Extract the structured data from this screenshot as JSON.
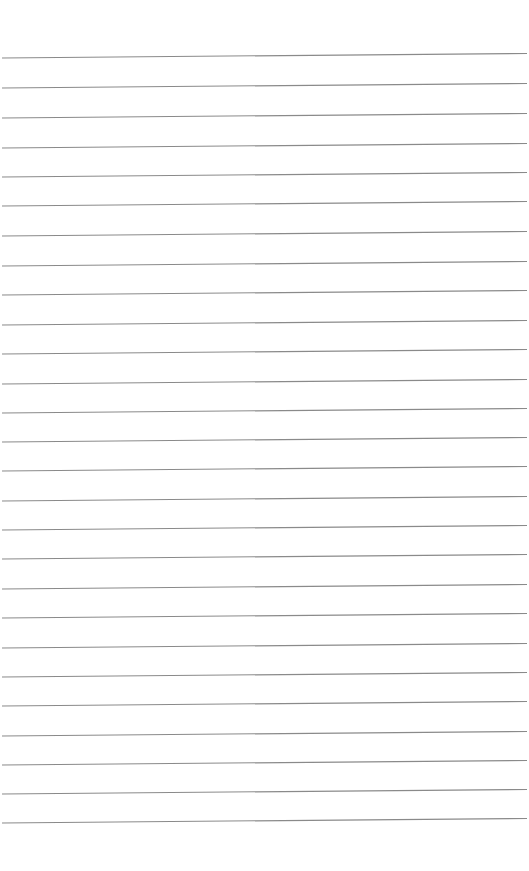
{
  "page": {
    "type": "blank lined paper",
    "background_color": "#ffffff",
    "line_color": "#8a8a8a",
    "line_count": 27,
    "line_start_x": 2,
    "line_end_x": 527,
    "left_y": [
      58,
      88,
      118,
      148,
      177,
      206,
      236,
      266,
      295,
      325,
      354,
      384,
      413,
      442,
      471,
      501,
      530,
      559,
      589,
      618,
      648,
      677,
      706,
      736,
      765,
      794,
      823
    ],
    "right_y_offset": -4.5
  }
}
